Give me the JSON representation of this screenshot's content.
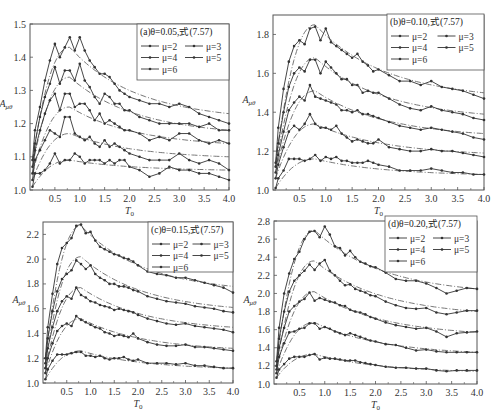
{
  "chart_data": [
    {
      "type": "line",
      "panel": "a",
      "title": "(a)θ=0.05,式(7.57)",
      "xlabel": "T_0",
      "ylabel": "A_μθ",
      "xlim": [
        0,
        4.0
      ],
      "ylim": [
        1.0,
        1.5
      ],
      "xticks": [
        "0.5",
        "1.0",
        "1.5",
        "2.0",
        "2.5",
        "3.0",
        "3.5",
        "4.0"
      ],
      "yticks": [
        "1.0",
        "1.1",
        "1.2",
        "1.3",
        "1.4",
        "1.5"
      ],
      "legend": [
        "μ=2",
        "μ=3",
        "μ=4",
        "μ=5",
        "μ=6"
      ],
      "legend_position": "upper right",
      "x": [
        0.05,
        0.1,
        0.2,
        0.3,
        0.4,
        0.5,
        0.6,
        0.7,
        0.8,
        0.9,
        1.0,
        1.1,
        1.2,
        1.3,
        1.4,
        1.5,
        1.6,
        1.7,
        1.8,
        1.9,
        2.0,
        2.2,
        2.4,
        2.6,
        2.8,
        3.0,
        3.2,
        3.4,
        3.6,
        3.8,
        4.0
      ],
      "series": [
        {
          "name": "μ=2",
          "values": [
            1.01,
            1.05,
            1.05,
            1.06,
            1.08,
            1.11,
            1.08,
            1.09,
            1.09,
            1.11,
            1.1,
            1.08,
            1.09,
            1.09,
            1.09,
            1.08,
            1.09,
            1.08,
            1.09,
            1.09,
            1.07,
            1.06,
            1.04,
            1.05,
            1.07,
            1.06,
            1.06,
            1.05,
            1.05,
            1.04,
            1.03
          ]
        },
        {
          "name": "μ=3",
          "values": [
            1.03,
            1.09,
            1.12,
            1.15,
            1.18,
            1.17,
            1.16,
            1.22,
            1.22,
            1.17,
            1.16,
            1.15,
            1.16,
            1.14,
            1.13,
            1.15,
            1.13,
            1.14,
            1.13,
            1.12,
            1.11,
            1.1,
            1.09,
            1.09,
            1.09,
            1.11,
            1.09,
            1.08,
            1.09,
            1.08,
            1.06
          ]
        },
        {
          "name": "μ=4",
          "values": [
            1.05,
            1.12,
            1.18,
            1.23,
            1.27,
            1.29,
            1.24,
            1.29,
            1.29,
            1.25,
            1.26,
            1.26,
            1.24,
            1.21,
            1.23,
            1.2,
            1.21,
            1.2,
            1.19,
            1.18,
            1.18,
            1.17,
            1.15,
            1.16,
            1.15,
            1.17,
            1.17,
            1.15,
            1.14,
            1.15,
            1.14
          ]
        },
        {
          "name": "μ=5",
          "values": [
            1.07,
            1.14,
            1.22,
            1.28,
            1.32,
            1.37,
            1.32,
            1.36,
            1.36,
            1.33,
            1.38,
            1.33,
            1.31,
            1.28,
            1.26,
            1.29,
            1.28,
            1.26,
            1.26,
            1.24,
            1.24,
            1.22,
            1.21,
            1.2,
            1.2,
            1.2,
            1.2,
            1.19,
            1.2,
            1.18,
            1.18
          ]
        },
        {
          "name": "μ=6",
          "values": [
            1.09,
            1.18,
            1.25,
            1.33,
            1.39,
            1.44,
            1.4,
            1.43,
            1.46,
            1.42,
            1.46,
            1.42,
            1.39,
            1.37,
            1.35,
            1.35,
            1.34,
            1.32,
            1.3,
            1.29,
            1.28,
            1.27,
            1.26,
            1.26,
            1.25,
            1.26,
            1.25,
            1.23,
            1.22,
            1.21,
            1.2
          ]
        }
      ],
      "fit_curves": {
        "style": "dash-dot",
        "peaks": [
          1.09,
          1.17,
          1.25,
          1.34,
          1.43
        ],
        "ends": [
          1.06,
          1.1,
          1.14,
          1.18,
          1.23
        ]
      }
    },
    {
      "type": "line",
      "panel": "b",
      "title": "(b)θ=0.10,式(7.57)",
      "xlabel": "T_0",
      "ylabel": "A_μθ",
      "xlim": [
        0,
        4.0
      ],
      "ylim": [
        1.0,
        1.9
      ],
      "xticks": [
        "0.5",
        "1.0",
        "1.5",
        "2.0",
        "2.5",
        "3.0",
        "3.5",
        "4.0"
      ],
      "yticks": [
        "1.0",
        "1.2",
        "1.4",
        "1.6",
        "1.8"
      ],
      "legend": [
        "μ=2",
        "μ=3",
        "μ=4",
        "μ=5",
        "μ=6"
      ],
      "legend_position": "upper right",
      "x": [
        0.05,
        0.1,
        0.2,
        0.3,
        0.4,
        0.5,
        0.6,
        0.7,
        0.8,
        0.9,
        1.0,
        1.1,
        1.2,
        1.3,
        1.4,
        1.5,
        1.6,
        1.7,
        1.8,
        1.9,
        2.0,
        2.2,
        2.4,
        2.6,
        2.8,
        3.0,
        3.2,
        3.4,
        3.6,
        3.8,
        4.0
      ],
      "series": [
        {
          "name": "μ=2",
          "values": [
            1.01,
            1.06,
            1.1,
            1.16,
            1.16,
            1.16,
            1.15,
            1.16,
            1.18,
            1.15,
            1.17,
            1.16,
            1.17,
            1.15,
            1.15,
            1.14,
            1.14,
            1.14,
            1.15,
            1.14,
            1.13,
            1.12,
            1.1,
            1.1,
            1.1,
            1.11,
            1.1,
            1.09,
            1.09,
            1.08,
            1.08
          ]
        },
        {
          "name": "μ=3",
          "values": [
            1.06,
            1.13,
            1.22,
            1.3,
            1.33,
            1.31,
            1.34,
            1.39,
            1.34,
            1.32,
            1.32,
            1.31,
            1.33,
            1.29,
            1.27,
            1.25,
            1.26,
            1.25,
            1.24,
            1.24,
            1.26,
            1.22,
            1.21,
            1.2,
            1.2,
            1.21,
            1.2,
            1.2,
            1.19,
            1.18,
            1.17
          ]
        },
        {
          "name": "μ=4",
          "values": [
            1.09,
            1.18,
            1.3,
            1.41,
            1.45,
            1.48,
            1.46,
            1.54,
            1.48,
            1.47,
            1.46,
            1.45,
            1.44,
            1.41,
            1.41,
            1.4,
            1.41,
            1.39,
            1.39,
            1.38,
            1.37,
            1.35,
            1.33,
            1.32,
            1.31,
            1.32,
            1.31,
            1.3,
            1.29,
            1.27,
            1.26
          ]
        },
        {
          "name": "μ=5",
          "values": [
            1.12,
            1.24,
            1.4,
            1.53,
            1.6,
            1.63,
            1.61,
            1.67,
            1.67,
            1.6,
            1.66,
            1.63,
            1.6,
            1.57,
            1.57,
            1.54,
            1.54,
            1.5,
            1.51,
            1.5,
            1.5,
            1.47,
            1.44,
            1.42,
            1.41,
            1.43,
            1.41,
            1.4,
            1.39,
            1.37,
            1.36
          ]
        },
        {
          "name": "μ=6",
          "values": [
            1.14,
            1.32,
            1.52,
            1.66,
            1.74,
            1.77,
            1.75,
            1.83,
            1.84,
            1.77,
            1.83,
            1.76,
            1.74,
            1.72,
            1.7,
            1.68,
            1.7,
            1.66,
            1.64,
            1.61,
            1.62,
            1.59,
            1.56,
            1.56,
            1.54,
            1.56,
            1.53,
            1.52,
            1.51,
            1.49,
            1.47
          ]
        }
      ],
      "fit_curves": {
        "style": "dash-dot",
        "peaks": [
          1.16,
          1.34,
          1.51,
          1.68,
          1.85
        ],
        "ends": [
          1.08,
          1.19,
          1.29,
          1.39,
          1.5
        ]
      }
    },
    {
      "type": "line",
      "panel": "c",
      "title": "(c)θ=0.15,式(7.57)",
      "xlabel": "T_0",
      "ylabel": "A_μθ",
      "xlim": [
        0,
        4.0
      ],
      "ylim": [
        1.0,
        2.3
      ],
      "xticks": [
        "0.5",
        "1.0",
        "1.5",
        "2.0",
        "2.5",
        "3.0",
        "3.5",
        "4.0"
      ],
      "yticks": [
        "1.0",
        "1.2",
        "1.4",
        "1.6",
        "1.8",
        "2.0",
        "2.2"
      ],
      "legend": [
        "μ=2",
        "μ=3",
        "μ=4",
        "μ=5",
        "μ=6"
      ],
      "legend_position": "upper right",
      "x": [
        0.05,
        0.1,
        0.2,
        0.3,
        0.4,
        0.5,
        0.6,
        0.7,
        0.8,
        0.9,
        1.0,
        1.1,
        1.2,
        1.3,
        1.4,
        1.5,
        1.6,
        1.7,
        1.8,
        1.9,
        2.0,
        2.2,
        2.4,
        2.6,
        2.8,
        3.0,
        3.2,
        3.4,
        3.6,
        3.8,
        4.0
      ],
      "series": [
        {
          "name": "μ=2",
          "values": [
            1.03,
            1.11,
            1.18,
            1.23,
            1.23,
            1.23,
            1.24,
            1.25,
            1.25,
            1.22,
            1.22,
            1.21,
            1.22,
            1.2,
            1.19,
            1.2,
            1.2,
            1.21,
            1.19,
            1.18,
            1.19,
            1.16,
            1.16,
            1.16,
            1.15,
            1.16,
            1.14,
            1.14,
            1.13,
            1.12,
            1.12
          ]
        },
        {
          "name": "μ=3",
          "values": [
            1.08,
            1.2,
            1.32,
            1.42,
            1.46,
            1.48,
            1.46,
            1.54,
            1.51,
            1.49,
            1.47,
            1.45,
            1.44,
            1.41,
            1.4,
            1.38,
            1.39,
            1.38,
            1.37,
            1.4,
            1.36,
            1.33,
            1.31,
            1.3,
            1.3,
            1.31,
            1.29,
            1.29,
            1.28,
            1.27,
            1.26
          ]
        },
        {
          "name": "μ=4",
          "values": [
            1.12,
            1.28,
            1.45,
            1.58,
            1.66,
            1.7,
            1.68,
            1.77,
            1.71,
            1.69,
            1.66,
            1.65,
            1.63,
            1.62,
            1.61,
            1.59,
            1.6,
            1.59,
            1.58,
            1.57,
            1.55,
            1.52,
            1.5,
            1.48,
            1.47,
            1.48,
            1.46,
            1.45,
            1.44,
            1.43,
            1.41
          ]
        },
        {
          "name": "μ=5",
          "values": [
            1.16,
            1.36,
            1.58,
            1.74,
            1.84,
            1.88,
            1.91,
            1.99,
            1.96,
            1.92,
            1.95,
            1.88,
            1.85,
            1.83,
            1.8,
            1.8,
            1.78,
            1.78,
            1.77,
            1.75,
            1.74,
            1.7,
            1.68,
            1.66,
            1.65,
            1.64,
            1.62,
            1.61,
            1.6,
            1.58,
            1.57
          ]
        },
        {
          "name": "μ=6",
          "values": [
            1.2,
            1.45,
            1.72,
            1.96,
            2.09,
            2.13,
            2.17,
            2.27,
            2.28,
            2.21,
            2.22,
            2.15,
            2.1,
            2.08,
            2.06,
            2.04,
            2.03,
            2.01,
            2.0,
            1.98,
            1.95,
            1.9,
            1.88,
            1.87,
            1.85,
            1.85,
            1.83,
            1.81,
            1.79,
            1.77,
            1.73
          ]
        }
      ],
      "fit_curves": {
        "style": "dash-dot",
        "peaks": [
          1.26,
          1.52,
          1.77,
          2.02,
          2.27
        ],
        "ends": [
          1.12,
          1.28,
          1.45,
          1.61,
          1.78
        ]
      }
    },
    {
      "type": "line",
      "panel": "d",
      "title": "(d)θ=0.20,式(7.57)",
      "xlabel": "T_0",
      "ylabel": "A_μθ",
      "xlim": [
        0,
        4.0
      ],
      "ylim": [
        1.0,
        2.8
      ],
      "xticks": [
        "0.5",
        "1.0",
        "1.5",
        "2.0",
        "2.5",
        "3.0",
        "3.5",
        "4.0"
      ],
      "yticks": [
        "1.0",
        "1.2",
        "1.4",
        "1.6",
        "1.8",
        "2.0",
        "2.2",
        "2.4",
        "2.6",
        "2.8"
      ],
      "legend": [
        "μ=2",
        "μ=3",
        "μ=4",
        "μ=5",
        "μ=6"
      ],
      "legend_position": "upper right",
      "x": [
        0.05,
        0.1,
        0.2,
        0.3,
        0.4,
        0.5,
        0.6,
        0.7,
        0.8,
        0.9,
        1.0,
        1.1,
        1.2,
        1.3,
        1.4,
        1.5,
        1.6,
        1.7,
        1.8,
        1.9,
        2.0,
        2.2,
        2.4,
        2.6,
        2.8,
        3.0,
        3.2,
        3.4,
        3.6,
        3.8,
        4.0
      ],
      "series": [
        {
          "name": "μ=2",
          "values": [
            1.07,
            1.16,
            1.22,
            1.28,
            1.3,
            1.3,
            1.3,
            1.32,
            1.33,
            1.27,
            1.29,
            1.28,
            1.28,
            1.27,
            1.26,
            1.26,
            1.26,
            1.24,
            1.23,
            1.22,
            1.21,
            1.19,
            1.18,
            1.18,
            1.17,
            1.17,
            1.15,
            1.14,
            1.15,
            1.15,
            1.15
          ]
        },
        {
          "name": "μ=3",
          "values": [
            1.12,
            1.3,
            1.45,
            1.57,
            1.58,
            1.61,
            1.62,
            1.67,
            1.67,
            1.61,
            1.63,
            1.61,
            1.58,
            1.56,
            1.54,
            1.56,
            1.54,
            1.52,
            1.5,
            1.48,
            1.47,
            1.44,
            1.43,
            1.4,
            1.37,
            1.38,
            1.36,
            1.35,
            1.35,
            1.35,
            1.35
          ]
        },
        {
          "name": "μ=4",
          "values": [
            1.16,
            1.4,
            1.62,
            1.8,
            1.86,
            1.91,
            1.94,
            2.01,
            1.92,
            1.95,
            1.93,
            1.91,
            1.9,
            1.87,
            1.86,
            1.82,
            1.8,
            1.79,
            1.77,
            1.74,
            1.72,
            1.68,
            1.65,
            1.63,
            1.61,
            1.62,
            1.58,
            1.52,
            1.56,
            1.57,
            1.58
          ]
        },
        {
          "name": "μ=5",
          "values": [
            1.2,
            1.5,
            1.8,
            2.02,
            2.14,
            2.2,
            2.25,
            2.32,
            2.26,
            2.33,
            2.37,
            2.25,
            2.2,
            2.14,
            2.09,
            2.1,
            2.05,
            2.03,
            2.01,
            1.98,
            1.97,
            1.91,
            1.87,
            1.84,
            1.83,
            1.84,
            1.79,
            1.77,
            1.79,
            1.81,
            1.81
          ]
        },
        {
          "name": "μ=6",
          "values": [
            1.25,
            1.62,
            2.0,
            2.22,
            2.38,
            2.46,
            2.6,
            2.68,
            2.69,
            2.62,
            2.74,
            2.65,
            2.52,
            2.5,
            2.42,
            2.47,
            2.4,
            2.35,
            2.33,
            2.3,
            2.29,
            2.23,
            2.16,
            2.14,
            2.14,
            2.11,
            2.06,
            2.0,
            2.03,
            2.06,
            2.05
          ]
        }
      ],
      "fit_curves": {
        "style": "dash-dot",
        "peaks": [
          1.33,
          1.68,
          2.02,
          2.36,
          2.7
        ],
        "ends": [
          1.14,
          1.35,
          1.57,
          1.8,
          2.05
        ]
      }
    }
  ],
  "panels": [
    {
      "title": "(a)θ=0.05,式(7.57)",
      "xlabel": "T",
      "xlabel_sub": "0",
      "ylabel": "A",
      "ylabel_sub": "μθ"
    },
    {
      "title": "(b)θ=0.10,式(7.57)",
      "xlabel": "T",
      "xlabel_sub": "0",
      "ylabel": "A",
      "ylabel_sub": "μθ"
    },
    {
      "title": "(c)θ=0.15,式(7.57)",
      "xlabel": "T",
      "xlabel_sub": "0",
      "ylabel": "A",
      "ylabel_sub": "μθ"
    },
    {
      "title": "(d)θ=0.20,式(7.57)",
      "xlabel": "T",
      "xlabel_sub": "0",
      "ylabel": "A",
      "ylabel_sub": "μθ"
    }
  ],
  "legend_labels": [
    "μ=2",
    "μ=3",
    "μ=4",
    "μ=5",
    "μ=6"
  ],
  "colors": {
    "line": "#333333",
    "fit": "#777777",
    "frame": "#555555",
    "background": "#ffffff"
  }
}
